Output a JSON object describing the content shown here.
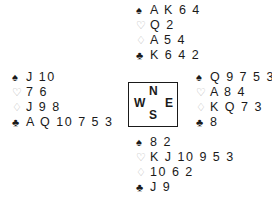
{
  "suits": {
    "spades": "♠",
    "hearts": "♡",
    "diamonds": "♢",
    "clubs": "♣"
  },
  "hands": {
    "north": {
      "spades": "A K 6 4",
      "hearts": "Q 2",
      "diamonds": "A 5 4",
      "clubs": "K 6 4 2"
    },
    "west": {
      "spades": "J 10",
      "hearts": "7 6",
      "diamonds": "J 9 8",
      "clubs": "A Q 10 7 5 3"
    },
    "east": {
      "spades": "Q 9 7 5 3",
      "hearts": "A 8 4",
      "diamonds": "K Q 7 3",
      "clubs": "8"
    },
    "south": {
      "spades": "8 2",
      "hearts": "K J 10 9 5 3",
      "diamonds": "10 6 2",
      "clubs": "J 9"
    }
  },
  "compass": {
    "north": "N",
    "west": "W",
    "east": "E",
    "south": "S"
  }
}
